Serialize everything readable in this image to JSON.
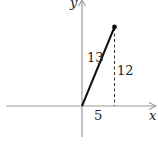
{
  "diagram": {
    "type": "right-triangle-vector",
    "axes": {
      "x_label": "x",
      "y_label": "y",
      "color": "#9a9a9a"
    },
    "vector": {
      "from": [
        0,
        0
      ],
      "to": [
        5,
        12
      ],
      "color": "#111111"
    },
    "labels": {
      "hypotenuse": "13",
      "opposite": "12",
      "adjacent": "5"
    },
    "dashed_line": {
      "description": "vertical drop from point to x-axis",
      "color": "#333333"
    }
  }
}
